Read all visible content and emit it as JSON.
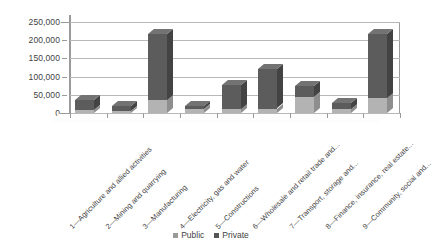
{
  "chart_data": {
    "type": "bar",
    "title": "",
    "subtitle": "",
    "xlabel": "",
    "ylabel": "",
    "ylim": [
      0,
      250000
    ],
    "grid": true,
    "stacked": true,
    "legend_position": "bottom",
    "y_ticks": [
      "0",
      "50,000",
      "100,000",
      "150,000",
      "200,000",
      "250,000"
    ],
    "y_tick_values": [
      0,
      50000,
      100000,
      150000,
      200000,
      250000
    ],
    "categories": [
      "1—Agriculture and allied activities",
      "2—Mining and quarrying",
      "3—Manufacturing",
      "4—Electricity, gas and water",
      "5—Constructions",
      "6—Wholesale and retail trade and...",
      "7—Transport, storage and...",
      "8—Finance, insurance, real estate...",
      "9—Community, social and..."
    ],
    "series": [
      {
        "name": "Public",
        "color": "#b3b3b3",
        "values": [
          8000,
          5000,
          35000,
          12000,
          10000,
          12000,
          45000,
          10000,
          40000
        ]
      },
      {
        "name": "Private",
        "color": "#5c5c5c",
        "values": [
          27000,
          13000,
          183000,
          8000,
          68000,
          108000,
          30000,
          18000,
          178000
        ]
      }
    ],
    "totals": [
      35000,
      18000,
      218000,
      20000,
      78000,
      120000,
      75000,
      28000,
      218000
    ]
  },
  "legend": {
    "items": [
      {
        "label": "Public"
      },
      {
        "label": "Private"
      }
    ]
  }
}
